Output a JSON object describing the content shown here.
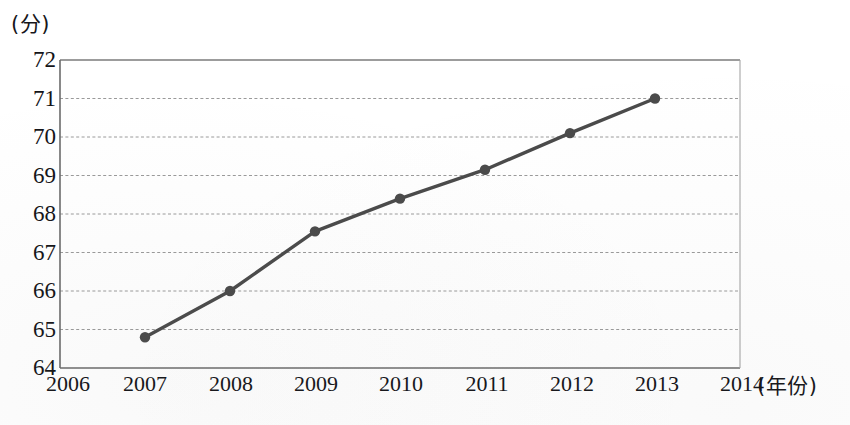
{
  "chart_data": {
    "type": "line",
    "title": "",
    "subtitle": "",
    "xlabel": "(年份)",
    "ylabel": "(分)",
    "x": [
      2007,
      2008,
      2009,
      2010,
      2011,
      2012,
      2013
    ],
    "values": [
      64.8,
      66.0,
      67.55,
      68.4,
      69.15,
      70.1,
      71.0
    ],
    "series": [
      {
        "name": "",
        "values": [
          64.8,
          66.0,
          67.55,
          68.4,
          69.15,
          70.1,
          71.0
        ]
      }
    ],
    "x_tick_labels": [
      "2006",
      "2007",
      "2008",
      "2009",
      "2010",
      "2011",
      "2012",
      "2013",
      "2014"
    ],
    "y_tick_labels": [
      "64",
      "65",
      "66",
      "67",
      "68",
      "69",
      "70",
      "71",
      "72"
    ],
    "xlim": [
      2006,
      2014
    ],
    "ylim": [
      64,
      72
    ],
    "y_tick_step": 1,
    "grid": true,
    "grid_axis": "y",
    "grid_style": "dashed",
    "legend": false,
    "legend_position": "none",
    "marker": "circle",
    "line_color": "#4a4a4a",
    "marker_color": "#4a4a4a",
    "grid_color": "#9a9a9a",
    "axis_color": "#6e6e6e",
    "text_color": "#141418",
    "background_color": "#ffffff"
  }
}
